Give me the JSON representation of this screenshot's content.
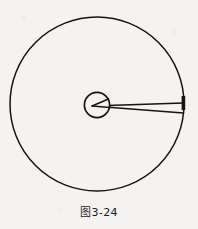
{
  "figure": {
    "caption": "图3-24",
    "background_color": "#f4f3f1",
    "ink_color": "#151413",
    "elements": {
      "outer_circle": {
        "name": "large-circle",
        "center_x": 97,
        "center_y": 104,
        "radius": 87,
        "stroke_width": 1.5
      },
      "inner_circle": {
        "name": "small-circle",
        "center_x": 97,
        "center_y": 105,
        "radius": 13,
        "stroke_width": 1.6
      },
      "wedge_vertex": {
        "name": "wedge-vertex",
        "x": 92,
        "y": 106
      },
      "wedge_upper_line": {
        "name": "wedge-upper-line",
        "x1": 92,
        "y1": 106,
        "x2": 183,
        "y2": 103
      },
      "wedge_lower_line": {
        "name": "wedge-lower-line",
        "x1": 92,
        "y1": 106,
        "x2": 183,
        "y2": 113
      },
      "edge_tick": {
        "name": "edge-tick-mark",
        "x": 182,
        "y": 96,
        "width": 4,
        "height": 14
      }
    }
  }
}
